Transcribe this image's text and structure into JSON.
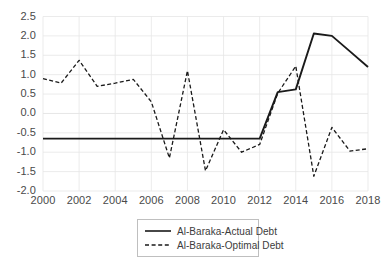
{
  "chart_data": {
    "type": "line",
    "title": "",
    "xlabel": "",
    "ylabel": "",
    "x": [
      2000,
      2001,
      2002,
      2003,
      2004,
      2005,
      2006,
      2007,
      2008,
      2009,
      2010,
      2011,
      2012,
      2013,
      2014,
      2015,
      2016,
      2017,
      2018
    ],
    "x_tick_labels": [
      "2000",
      "2002",
      "2004",
      "2006",
      "2008",
      "2010",
      "2012",
      "2014",
      "2016",
      "2018"
    ],
    "x_ticks": [
      2000,
      2002,
      2004,
      2006,
      2008,
      2010,
      2012,
      2014,
      2016,
      2018
    ],
    "y_tick_labels": [
      "2.5",
      "2.0",
      "1.5",
      "1.0",
      "0.5",
      "0.0",
      "-0.5",
      "-1.0",
      "-1.5",
      "-2.0"
    ],
    "y_ticks": [
      2.5,
      2.0,
      1.5,
      1.0,
      0.5,
      0.0,
      -0.5,
      -1.0,
      -1.5,
      -2.0
    ],
    "xlim": [
      2000,
      2018
    ],
    "ylim": [
      -2.0,
      2.5
    ],
    "grid": true,
    "legend_position": "bottom-center",
    "series": [
      {
        "name": "Al-Baraka-Actual Debt",
        "style": "solid",
        "color": "#1a1a1a",
        "values": [
          -0.65,
          -0.65,
          -0.65,
          -0.65,
          -0.65,
          -0.65,
          -0.65,
          -0.65,
          -0.65,
          -0.65,
          -0.65,
          -0.65,
          -0.65,
          0.55,
          0.62,
          2.06,
          2.0,
          1.6,
          1.2
        ]
      },
      {
        "name": "Al-Baraka-Optimal Debt",
        "style": "dashed",
        "color": "#1a1a1a",
        "values": [
          0.9,
          0.78,
          1.37,
          0.7,
          0.78,
          0.88,
          0.3,
          -1.15,
          1.1,
          -1.48,
          -0.42,
          -1.0,
          -0.8,
          0.52,
          1.22,
          -1.62,
          -0.36,
          -0.97,
          -0.91
        ]
      }
    ]
  },
  "legend": {
    "items": [
      {
        "label": "Al-Baraka-Actual Debt",
        "style": "solid"
      },
      {
        "label": "Al-Baraka-Optimal Debt",
        "style": "dashed"
      }
    ]
  },
  "colors": {
    "series_line": "#1a1a1a",
    "gridline": "#e6e6e6",
    "tick_text": "#4a4a4a",
    "legend_border": "#bfbfbf",
    "background": "#ffffff"
  }
}
